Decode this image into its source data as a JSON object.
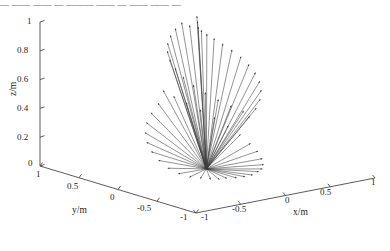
{
  "figure": {
    "type": "3d-quiver",
    "background_color": "#ffffff",
    "arrow_color": "#3a3a3a",
    "axis_color": "#4a4a4a",
    "top_text_fragment": "— —— —— — ——— ——  — —— —— —"
  },
  "axes": {
    "x": {
      "title": "x/m",
      "ticks": [
        "-1",
        "-0.5",
        "0",
        "0.5",
        "1"
      ],
      "min": -1,
      "max": 1
    },
    "y": {
      "title": "y/m",
      "ticks": [
        "1",
        "0.5",
        "0",
        "-0.5",
        "-1"
      ],
      "min": -1,
      "max": 1
    },
    "z": {
      "title": "z/m",
      "ticks": [
        "0",
        "0.2",
        "0.4",
        "0.6",
        "0.8",
        "1"
      ],
      "min": 0,
      "max": 1
    }
  },
  "chart_data": {
    "type": "scatter",
    "title": "",
    "xlabel": "x/m",
    "ylabel": "y/m",
    "zlabel": "z/m",
    "xlim": [
      -1,
      1
    ],
    "ylim": [
      -1,
      1
    ],
    "zlim": [
      0,
      1
    ],
    "grid": false,
    "legend": "none",
    "origin": {
      "x": -0.1,
      "y": -0.1,
      "z": 0.05
    },
    "vectors": [
      {
        "az": 96,
        "el": 84,
        "len": 0.92
      },
      {
        "az": 84,
        "el": 82,
        "len": 0.95
      },
      {
        "az": 108,
        "el": 80,
        "len": 0.9
      },
      {
        "az": 72,
        "el": 79,
        "len": 0.88
      },
      {
        "az": 120,
        "el": 77,
        "len": 0.93
      },
      {
        "az": 60,
        "el": 76,
        "len": 0.86
      },
      {
        "az": 132,
        "el": 74,
        "len": 0.91
      },
      {
        "az": 48,
        "el": 73,
        "len": 0.84
      },
      {
        "az": 144,
        "el": 71,
        "len": 0.89
      },
      {
        "az": 36,
        "el": 70,
        "len": 0.82
      },
      {
        "az": 156,
        "el": 68,
        "len": 0.87
      },
      {
        "az": 24,
        "el": 67,
        "len": 0.8
      },
      {
        "az": 168,
        "el": 65,
        "len": 0.85
      },
      {
        "az": 12,
        "el": 64,
        "len": 0.78
      },
      {
        "az": 180,
        "el": 62,
        "len": 0.83
      },
      {
        "az": 0,
        "el": 61,
        "len": 0.76
      },
      {
        "az": 192,
        "el": 59,
        "len": 0.81
      },
      {
        "az": 348,
        "el": 58,
        "len": 0.74
      },
      {
        "az": 204,
        "el": 56,
        "len": 0.79
      },
      {
        "az": 336,
        "el": 55,
        "len": 0.72
      },
      {
        "az": 216,
        "el": 53,
        "len": 0.77
      },
      {
        "az": 324,
        "el": 52,
        "len": 0.7
      },
      {
        "az": 228,
        "el": 50,
        "len": 0.75
      },
      {
        "az": 312,
        "el": 49,
        "len": 0.68
      },
      {
        "az": 240,
        "el": 47,
        "len": 0.73
      },
      {
        "az": 300,
        "el": 46,
        "len": 0.66
      },
      {
        "az": 252,
        "el": 44,
        "len": 0.71
      },
      {
        "az": 288,
        "el": 43,
        "len": 0.64
      },
      {
        "az": 264,
        "el": 41,
        "len": 0.69
      },
      {
        "az": 276,
        "el": 40,
        "len": 0.62
      },
      {
        "az": 90,
        "el": 38,
        "len": 0.67
      },
      {
        "az": 102,
        "el": 36,
        "len": 0.6
      },
      {
        "az": 78,
        "el": 34,
        "len": 0.65
      },
      {
        "az": 114,
        "el": 32,
        "len": 0.58
      },
      {
        "az": 66,
        "el": 30,
        "len": 0.63
      },
      {
        "az": 126,
        "el": 28,
        "len": 0.56
      },
      {
        "az": 54,
        "el": 26,
        "len": 0.61
      },
      {
        "az": 138,
        "el": 24,
        "len": 0.54
      },
      {
        "az": 42,
        "el": 22,
        "len": 0.59
      },
      {
        "az": 150,
        "el": 20,
        "len": 0.52
      },
      {
        "az": 30,
        "el": 18,
        "len": 0.57
      },
      {
        "az": 162,
        "el": 16,
        "len": 0.5
      },
      {
        "az": 18,
        "el": 14,
        "len": 0.55
      },
      {
        "az": 174,
        "el": 12,
        "len": 0.48
      },
      {
        "az": 6,
        "el": 10,
        "len": 0.53
      },
      {
        "az": 186,
        "el": 8,
        "len": 0.46
      },
      {
        "az": 354,
        "el": 7,
        "len": 0.51
      },
      {
        "az": 198,
        "el": 5,
        "len": 0.44
      },
      {
        "az": 342,
        "el": 4,
        "len": 0.49
      },
      {
        "az": 210,
        "el": 3,
        "len": 0.42
      },
      {
        "az": 330,
        "el": 2,
        "len": 0.47
      },
      {
        "az": 222,
        "el": 2,
        "len": 0.4
      },
      {
        "az": 318,
        "el": 1,
        "len": 0.45
      },
      {
        "az": 234,
        "el": 1,
        "len": 0.38
      },
      {
        "az": 306,
        "el": 1,
        "len": 0.43
      },
      {
        "az": 246,
        "el": 0,
        "len": 0.36
      },
      {
        "az": 294,
        "el": 0,
        "len": 0.41
      },
      {
        "az": 258,
        "el": 0,
        "len": 0.34
      },
      {
        "az": 282,
        "el": 0,
        "len": 0.39
      },
      {
        "az": 270,
        "el": 0,
        "len": 0.37
      }
    ]
  },
  "tick_positions": {
    "z": [
      {
        "label": "1",
        "x": 27,
        "y": 17
      },
      {
        "label": "0.8",
        "x": 17,
        "y": 46
      },
      {
        "label": "0.6",
        "x": 17,
        "y": 75
      },
      {
        "label": "0.4",
        "x": 17,
        "y": 104
      },
      {
        "label": "0.2",
        "x": 17,
        "y": 133
      },
      {
        "label": "0",
        "x": 28,
        "y": 159
      }
    ],
    "y": [
      {
        "label": "1",
        "x": 36,
        "y": 170
      },
      {
        "label": "0.5",
        "x": 67,
        "y": 182
      },
      {
        "label": "0",
        "x": 110,
        "y": 193
      },
      {
        "label": "-0.5",
        "x": 137,
        "y": 204
      },
      {
        "label": "-1",
        "x": 180,
        "y": 213
      }
    ],
    "x": [
      {
        "label": "-1",
        "x": 201,
        "y": 213
      },
      {
        "label": "-0.5",
        "x": 232,
        "y": 205
      },
      {
        "label": "0",
        "x": 285,
        "y": 196
      },
      {
        "label": "0.5",
        "x": 320,
        "y": 188
      },
      {
        "label": "1",
        "x": 371,
        "y": 178
      }
    ]
  },
  "axis_titles": [
    {
      "name": "z-axis-title",
      "text": "z/m",
      "x": 8,
      "y": 96
    },
    {
      "name": "y-axis-title",
      "text": "y/m",
      "x": 72,
      "y": 205
    },
    {
      "name": "x-axis-title",
      "text": "x/m",
      "x": 293,
      "y": 207
    }
  ]
}
